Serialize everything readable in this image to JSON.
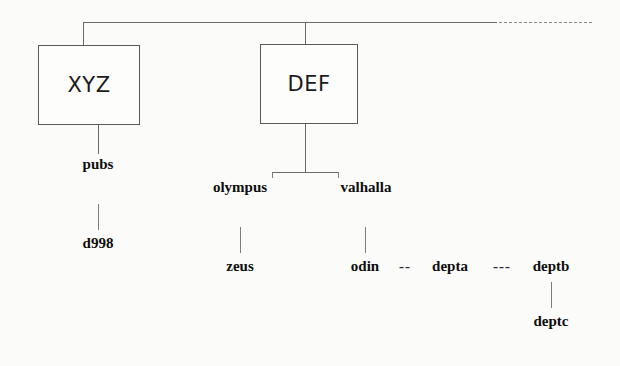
{
  "diagram": {
    "boxes": [
      {
        "id": "xyz",
        "label": "XYZ",
        "x": 38,
        "y": 45,
        "w": 102,
        "h": 80
      },
      {
        "id": "def",
        "label": "DEF",
        "x": 260,
        "y": 44,
        "w": 98,
        "h": 80
      }
    ],
    "nodes": [
      {
        "id": "pubs",
        "label": "pubs",
        "x": 98,
        "y": 164
      },
      {
        "id": "d998",
        "label": "d998",
        "x": 98,
        "y": 243
      },
      {
        "id": "olympus",
        "label": "olympus",
        "x": 240,
        "y": 187
      },
      {
        "id": "valhalla",
        "label": "valhalla",
        "x": 366,
        "y": 187
      },
      {
        "id": "zeus",
        "label": "zeus",
        "x": 240,
        "y": 266
      },
      {
        "id": "odin",
        "label": "odin",
        "x": 365,
        "y": 266
      },
      {
        "id": "depta",
        "label": "depta",
        "x": 450,
        "y": 266
      },
      {
        "id": "deptb",
        "label": "deptb",
        "x": 551,
        "y": 266
      },
      {
        "id": "deptc",
        "label": "deptc",
        "x": 551,
        "y": 321
      }
    ],
    "dash_connectors": [
      {
        "id": "odin-depta",
        "label": "--",
        "x": 405,
        "y": 266
      },
      {
        "id": "depta-deptb",
        "label": "---",
        "x": 502,
        "y": 266
      }
    ],
    "colors": {
      "background": "#fbfbfa",
      "line": "#6b6b6b",
      "box_border": "#5a5a5a",
      "text": "#0d0d0d",
      "dashed": "#8a8a8a"
    }
  }
}
